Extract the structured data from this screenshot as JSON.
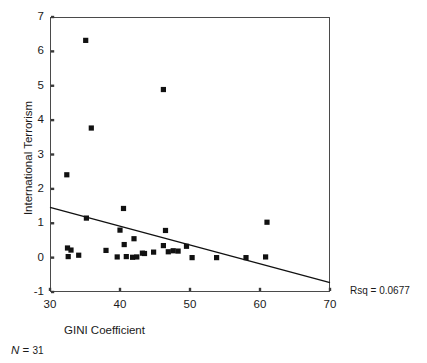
{
  "chart_data": {
    "type": "scatter",
    "title": "",
    "xlabel": "GINI Coefficient",
    "ylabel": "International Terrorism",
    "xlim": [
      30,
      70
    ],
    "ylim": [
      -1,
      7
    ],
    "xticks": [
      30,
      40,
      50,
      60,
      70
    ],
    "yticks": [
      -1,
      0,
      1,
      2,
      3,
      4,
      5,
      6,
      7
    ],
    "grid": false,
    "legend": null,
    "marker": "filled-square",
    "marker_color": "#111111",
    "n": 31,
    "rsq": 0.0677,
    "annotations": [
      {
        "name": "rsq",
        "text": "Rsq = 0.0677"
      },
      {
        "name": "sample-size",
        "text": "N = 31"
      }
    ],
    "points": [
      {
        "x": 35.1,
        "y": 6.32
      },
      {
        "x": 46.2,
        "y": 4.89
      },
      {
        "x": 35.9,
        "y": 3.77
      },
      {
        "x": 32.4,
        "y": 2.41
      },
      {
        "x": 40.5,
        "y": 1.43
      },
      {
        "x": 35.2,
        "y": 1.15
      },
      {
        "x": 61.0,
        "y": 1.03
      },
      {
        "x": 40.0,
        "y": 0.8
      },
      {
        "x": 46.5,
        "y": 0.79
      },
      {
        "x": 42.0,
        "y": 0.55
      },
      {
        "x": 40.6,
        "y": 0.38
      },
      {
        "x": 46.2,
        "y": 0.35
      },
      {
        "x": 49.5,
        "y": 0.33
      },
      {
        "x": 32.5,
        "y": 0.28
      },
      {
        "x": 33.0,
        "y": 0.22
      },
      {
        "x": 38.0,
        "y": 0.21
      },
      {
        "x": 47.6,
        "y": 0.2
      },
      {
        "x": 48.3,
        "y": 0.19
      },
      {
        "x": 46.9,
        "y": 0.17
      },
      {
        "x": 44.8,
        "y": 0.16
      },
      {
        "x": 43.2,
        "y": 0.13
      },
      {
        "x": 43.5,
        "y": 0.12
      },
      {
        "x": 32.6,
        "y": 0.03
      },
      {
        "x": 34.1,
        "y": 0.07
      },
      {
        "x": 40.9,
        "y": 0.03
      },
      {
        "x": 39.6,
        "y": 0.02
      },
      {
        "x": 41.8,
        "y": 0.01
      },
      {
        "x": 42.4,
        "y": 0.02
      },
      {
        "x": 50.3,
        "y": 0.0
      },
      {
        "x": 53.8,
        "y": 0.0
      },
      {
        "x": 58.0,
        "y": 0.0
      },
      {
        "x": 60.8,
        "y": 0.02
      }
    ],
    "fit_line": {
      "name": "linear-regression",
      "x1": 30,
      "y1": 1.46,
      "x2": 70,
      "y2": -0.73,
      "color": "#111111"
    }
  }
}
